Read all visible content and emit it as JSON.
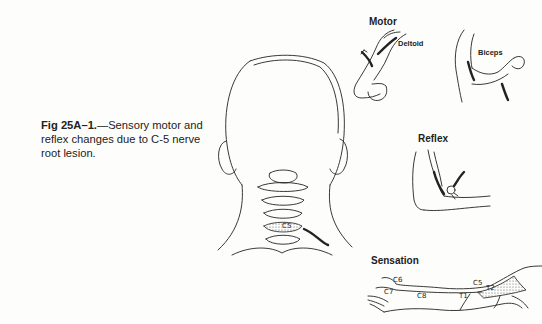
{
  "figure": {
    "caption": {
      "label": "Fig 25A–1.",
      "text": "—Sensory motor and reflex changes due to C-5 nerve root lesion."
    },
    "panels": {
      "motor": {
        "title": "Motor",
        "muscles": [
          "Deltoid",
          "Biceps"
        ]
      },
      "reflex": {
        "title": "Reflex"
      },
      "sensation": {
        "title": "Sensation",
        "dermatomes": [
          "C6",
          "C5",
          "C7",
          "C8",
          "T1",
          "T2"
        ],
        "highlighted": "C5"
      },
      "head": {
        "level_label": "C5"
      }
    }
  }
}
